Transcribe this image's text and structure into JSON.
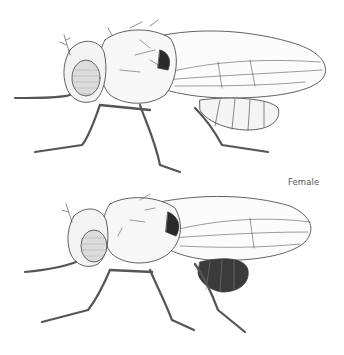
{
  "figure": {
    "label": "Female",
    "colors": {
      "background": "#ffffff",
      "ink": "#3a3a3a",
      "label": "#555555"
    },
    "specimens": [
      {
        "position": "top",
        "name": "male-fly"
      },
      {
        "position": "bottom",
        "name": "female-fly"
      }
    ]
  }
}
